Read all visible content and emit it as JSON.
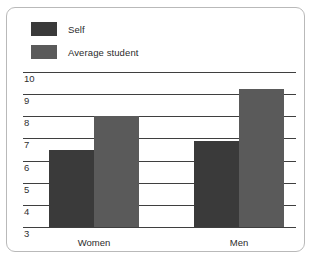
{
  "chart_data": {
    "type": "bar",
    "title": "",
    "subtitle": "",
    "xlabel": "",
    "ylabel": "",
    "categories": [
      "Women",
      "Men"
    ],
    "series": [
      {
        "name": "Self",
        "color": "#3a3a3a",
        "values": [
          6.5,
          6.9
        ]
      },
      {
        "name": "Average student",
        "color": "#5a5a5a",
        "values": [
          8.0,
          9.25
        ]
      }
    ],
    "ylim": [
      3,
      10
    ],
    "yticks": [
      3,
      4,
      5,
      6,
      7,
      8,
      9,
      10
    ],
    "ytick_labels": [
      "3",
      "4",
      "5",
      "6",
      "7",
      "8",
      "9",
      "10"
    ],
    "grid": "horizontal",
    "legend_position": "top-left",
    "annotations": []
  },
  "legend": {
    "items": [
      {
        "label": "Self",
        "color": "#3a3a3a"
      },
      {
        "label": "Average student",
        "color": "#5a5a5a"
      }
    ]
  },
  "axis": {
    "ytick_labels": [
      "10",
      "9",
      "8",
      "7",
      "6",
      "5",
      "4",
      "3"
    ],
    "xtick_labels": [
      "Women",
      "Men"
    ]
  },
  "colors": {
    "self": "#3a3a3a",
    "average_student": "#5a5a5a",
    "gridline": "#3f3f3f",
    "frame": "#b9b9b9",
    "background": "#ffffff",
    "text": "#2b2b2b"
  }
}
